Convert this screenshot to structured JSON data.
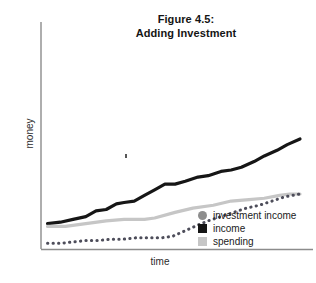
{
  "figure": {
    "title_line1": "Figure 4.5:",
    "title_line2": "Adding Investment"
  },
  "axes": {
    "ylabel": "money",
    "xlabel": "time",
    "axis_color": "#8c8c8c"
  },
  "legend": {
    "items": [
      {
        "label": "investment income",
        "marker": "circle",
        "color": "#8e8e8e",
        "name": "legend-marker-investment-income"
      },
      {
        "label": "income",
        "marker": "square",
        "color": "#161616",
        "name": "legend-marker-income"
      },
      {
        "label": "spending",
        "marker": "square",
        "color": "#c6c6c6",
        "name": "legend-marker-spending"
      }
    ]
  },
  "chart_data": {
    "type": "line",
    "title": "Figure 4.5: Adding Investment",
    "xlabel": "time",
    "ylabel": "money",
    "grid": false,
    "legend_position": "inside-bottom-right",
    "axis_ranges": {
      "x": [
        0,
        100
      ],
      "y": [
        0,
        100
      ]
    },
    "note": "Qualitative schematic line chart; axes have no numeric tick labels. Values below are read off pixel positions normalized to 0-100 where 0 is the x-axis baseline and 100 is the top of the plot area.",
    "series": [
      {
        "name": "income",
        "style": "solid",
        "color": "#161616",
        "width": 3.2,
        "x": [
          1,
          6,
          11,
          16,
          20,
          24,
          28,
          31,
          35,
          39,
          43,
          47,
          51,
          55,
          60,
          64,
          69,
          73,
          77,
          82,
          86,
          91,
          95,
          100
        ],
        "y": [
          18,
          19,
          21,
          23,
          27,
          28,
          32,
          33,
          34,
          38,
          42,
          46,
          46,
          48,
          51,
          52,
          55,
          56,
          58,
          62,
          66,
          70,
          74,
          78
        ]
      },
      {
        "name": "spending",
        "style": "solid",
        "color": "#c6c6c6",
        "width": 3.2,
        "x": [
          1,
          8,
          16,
          24,
          31,
          39,
          43,
          51,
          58,
          66,
          73,
          80,
          86,
          92,
          96,
          100
        ],
        "y": [
          16,
          16,
          18,
          20,
          21,
          21,
          22,
          26,
          29,
          31,
          34,
          35,
          36,
          38,
          39,
          39
        ]
      },
      {
        "name": "investment income",
        "style": "dotted",
        "color": "#4d4d5a",
        "width": 3.0,
        "x": [
          1,
          6,
          11,
          16,
          21,
          26,
          31,
          36,
          41,
          46,
          50,
          55,
          60,
          64,
          69,
          74,
          79,
          84,
          89,
          94,
          100
        ],
        "y": [
          4,
          4,
          5,
          6,
          6,
          7,
          7,
          8,
          8,
          8,
          9,
          13,
          17,
          20,
          23,
          26,
          29,
          31,
          34,
          37,
          39
        ]
      }
    ]
  }
}
